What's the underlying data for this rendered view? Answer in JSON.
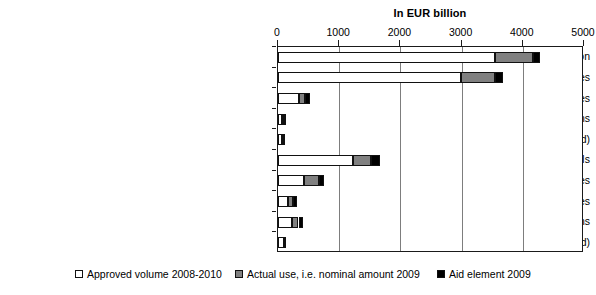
{
  "chart_data": {
    "type": "bar",
    "orientation": "horizontal",
    "stacked": true,
    "title": "In EUR billion",
    "xlabel": "",
    "ylabel": "",
    "xlim": [
      0,
      5000
    ],
    "xticks": [
      0,
      1000,
      2000,
      3000,
      4000,
      5000
    ],
    "xtick_labels": [
      "0",
      "1000",
      "2000",
      "3000",
      "4000",
      "5000"
    ],
    "grid": true,
    "grid_axis": "x",
    "legend_position": "bottom",
    "categories": [
      "Schemes with unlimited participation",
      "Schemes for guarantees",
      "Schemes for recapitalization measures",
      "Schemes for asset relief interventions",
      "Schemes for liquidity measures (guar antees excluded)",
      "Ad hoc interventions in favor of individual FIs",
      "Individual FI guarantees",
      "Individual FI recapitalization measures",
      "Individual FI asset relief interventions",
      "Individual FI liquidity measures (guarantees excluded)"
    ],
    "series": [
      {
        "name": "Approved volume 2008-2010",
        "color": "#ffffff",
        "values": [
          3540,
          2990,
          340,
          70,
          60,
          1225,
          420,
          170,
          230,
          90
        ]
      },
      {
        "name": "Actual use, i.e. nominal amount 2009",
        "color": "#808080",
        "values": [
          620,
          555,
          105,
          25,
          20,
          295,
          245,
          80,
          105,
          15
        ]
      },
      {
        "name": "Aid element 2009",
        "color": "#000000",
        "values": [
          115,
          130,
          80,
          15,
          20,
          145,
          80,
          55,
          75,
          10
        ]
      }
    ]
  },
  "legend": {
    "items": [
      {
        "label": "Approved volume 2008-2010"
      },
      {
        "label": "Actual use, i.e. nominal amount 2009"
      },
      {
        "label": "Aid element 2009"
      }
    ]
  }
}
